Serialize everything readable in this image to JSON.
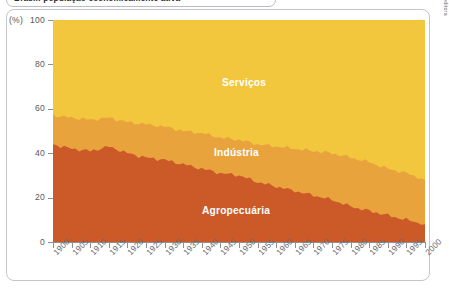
{
  "caption": {
    "text": "Brasil: população economicamente ativa"
  },
  "credit": "Caetano Rizão/Arquivo da editora",
  "axes": {
    "y_units": "(%)",
    "y_ticks": [
      100,
      80,
      60,
      40,
      20,
      0
    ],
    "y_min": 0,
    "y_max": 100,
    "x_ticks": [
      "1900",
      "1905",
      "1910",
      "1915",
      "1920",
      "1925",
      "1930",
      "1935",
      "1940",
      "1945",
      "1950",
      "1955",
      "1960",
      "1965",
      "1970",
      "1975",
      "1980",
      "1985",
      "1990",
      "1995",
      "2000"
    ],
    "x_min": 1900,
    "x_max": 2000,
    "grid": false
  },
  "colors": {
    "servicos": "#F2C73D",
    "industria": "#E8A33D",
    "agropecuaria": "#CC5A28",
    "axis": "#8E9093",
    "frame": "#C2C5C9",
    "label_text": "#FFFFFF",
    "tick_text": "#6A6C6E"
  },
  "band_labels": [
    {
      "name": "servicos",
      "text": "Serviços"
    },
    {
      "name": "industria",
      "text": "Indústria"
    },
    {
      "name": "agropecuaria",
      "text": "Agropecuária"
    }
  ],
  "chart_data": {
    "type": "area",
    "stacked": true,
    "normalized_percent": true,
    "title": "Brasil: população economicamente ativa",
    "xlabel": "",
    "ylabel": "(%)",
    "ylim": [
      0,
      100
    ],
    "xlim": [
      1900,
      2000
    ],
    "legend_position": "inline-band-labels",
    "x": [
      1900,
      1905,
      1910,
      1915,
      1920,
      1925,
      1930,
      1935,
      1940,
      1945,
      1950,
      1955,
      1960,
      1965,
      1970,
      1975,
      1980,
      1985,
      1990,
      1995,
      2000
    ],
    "series": [
      {
        "name": "Agropecuária",
        "color": "#CC5A28",
        "values": [
          44,
          42,
          41,
          43,
          40,
          38,
          37,
          35,
          33,
          31,
          30,
          27,
          25,
          23,
          21,
          19,
          16,
          14,
          12,
          10,
          8
        ]
      },
      {
        "name": "Indústria",
        "color": "#E8A33D",
        "values": [
          13,
          14,
          14,
          13,
          14,
          15,
          15,
          15,
          16,
          16,
          16,
          17,
          18,
          19,
          20,
          21,
          22,
          22,
          21,
          21,
          20
        ]
      },
      {
        "name": "Serviços",
        "color": "#F2C73D",
        "values": [
          43,
          44,
          45,
          44,
          46,
          47,
          48,
          50,
          51,
          53,
          54,
          56,
          57,
          58,
          59,
          60,
          62,
          64,
          67,
          69,
          72
        ]
      }
    ],
    "cumulative_upper_boundaries": {
      "agropecuaria_top": [
        44,
        42,
        41,
        43,
        40,
        38,
        37,
        35,
        33,
        31,
        30,
        27,
        25,
        23,
        21,
        19,
        16,
        14,
        12,
        10,
        8
      ],
      "industria_top": [
        57,
        56,
        55,
        56,
        54,
        53,
        52,
        50,
        49,
        47,
        46,
        44,
        43,
        42,
        41,
        40,
        38,
        36,
        33,
        31,
        28
      ]
    }
  }
}
